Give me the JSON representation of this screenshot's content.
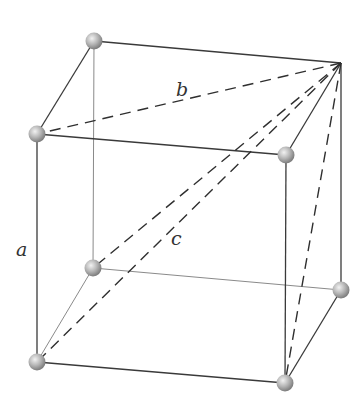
{
  "diagram": {
    "type": "cube-with-diagonals",
    "colors": {
      "front_edge": "#3a3a3a",
      "back_edge": "#8a8a8a",
      "diagonal": "#2f2f2f",
      "vertex_light": "#e8e8e8",
      "vertex_dark": "#8c8c8c"
    },
    "vertices": {
      "top_back_left": [
        94,
        41
      ],
      "top_back_right": [
        341,
        63
      ],
      "top_front_left": [
        37,
        134
      ],
      "top_front_right": [
        286,
        155
      ],
      "bottom_back_left": [
        93,
        268
      ],
      "bottom_back_right": [
        341,
        290
      ],
      "bottom_front_left": [
        37,
        362
      ],
      "bottom_front_right": [
        285,
        383
      ]
    },
    "labels": {
      "edge": "a",
      "face_diagonal": "b",
      "space_diagonal": "c"
    }
  }
}
